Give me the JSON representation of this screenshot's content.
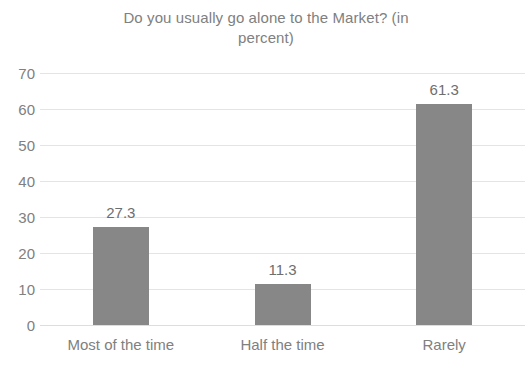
{
  "chart_data": {
    "type": "bar",
    "title": "Do you usually go alone to the Market? (in percent)",
    "title_line1": "Do you usually go alone to the Market? (in",
    "title_line2": "percent)",
    "categories": [
      "Most of the time",
      "Half the time",
      "Rarely"
    ],
    "values": [
      27.3,
      11.3,
      61.3
    ],
    "value_labels": [
      "27.3",
      "11.3",
      "61.3"
    ],
    "xlabel": "",
    "ylabel": "",
    "ylim": [
      0,
      70
    ],
    "y_ticks": [
      70,
      60,
      50,
      40,
      30,
      20,
      10,
      0
    ],
    "y_tick_labels": [
      "70",
      "60",
      "50",
      "40",
      "30",
      "20",
      "10",
      "0"
    ],
    "grid": true,
    "legend": false,
    "legend_position": "none",
    "series": [
      {
        "name": "Percent",
        "values": [
          27.3,
          11.3,
          61.3
        ]
      }
    ],
    "colors": {
      "bar": "#878787",
      "gridline": "#e4e4e4",
      "text": "#808080",
      "value_label": "#6e6e6e",
      "background": "#ffffff"
    }
  }
}
